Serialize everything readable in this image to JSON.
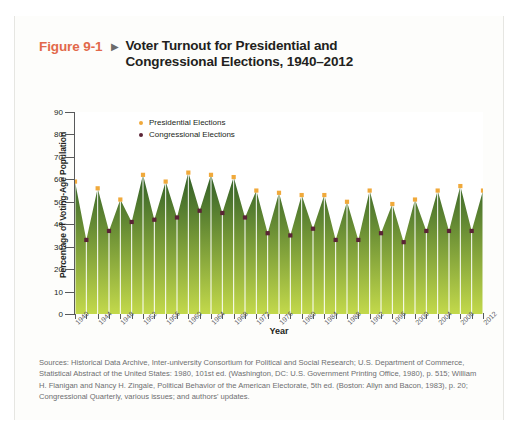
{
  "figure": {
    "label": "Figure 9-1",
    "arrow": "▶",
    "title": "Voter Turnout for Presidential and Congressional Elections, 1940–2012",
    "label_color": "#e2694a"
  },
  "legend": {
    "position": "top-left-inside",
    "items": [
      {
        "label": "Presidential Elections",
        "color": "#f0a93b",
        "marker": "legend-dot-presidential"
      },
      {
        "label": "Congressional Elections",
        "color": "#5b2436",
        "marker": "legend-dot-congressional"
      }
    ]
  },
  "sources": {
    "text": "Sources: Historical Data Archive, Inter-university Consortium for Political and Social Research; U.S. Department of Commerce, Statistical Abstract of the United States: 1980, 101st ed. (Washington, DC: U.S. Government Printing Office, 1980), p. 515; William H. Flanigan and Nancy H. Zingale, Political Behavior of the American Electorate, 5th ed. (Boston: Allyn and Bacon, 1983), p. 20; Congressional Quarterly, various issues; and authors' updates."
  },
  "chart_data": {
    "type": "area",
    "title": "Voter Turnout for Presidential and Congressional Elections, 1940–2012",
    "xlabel": "Year",
    "ylabel": "Percentage of Voting-Age Population",
    "ylim": [
      0,
      90
    ],
    "yticks": [
      0,
      10,
      20,
      30,
      40,
      50,
      60,
      70,
      80,
      90
    ],
    "xlim": [
      1940,
      2012
    ],
    "xticks_labeled": [
      1940,
      1944,
      1948,
      1952,
      1956,
      1960,
      1964,
      1968,
      1972,
      1976,
      1980,
      1984,
      1988,
      1992,
      1996,
      2000,
      2004,
      2008,
      2012
    ],
    "grid": false,
    "x": [
      1940,
      1942,
      1944,
      1946,
      1948,
      1950,
      1952,
      1954,
      1956,
      1958,
      1960,
      1962,
      1964,
      1966,
      1968,
      1970,
      1972,
      1974,
      1976,
      1978,
      1980,
      1982,
      1984,
      1986,
      1988,
      1990,
      1992,
      1994,
      1996,
      1998,
      2000,
      2002,
      2004,
      2006,
      2008,
      2010,
      2012
    ],
    "values": [
      59,
      33,
      56,
      37,
      51,
      41,
      62,
      42,
      59,
      43,
      63,
      46,
      62,
      45,
      61,
      43,
      55,
      36,
      54,
      35,
      53,
      38,
      53,
      33,
      50,
      33,
      55,
      36,
      49,
      32,
      51,
      37,
      55,
      37,
      57,
      37,
      55
    ],
    "series": [
      {
        "name": "Presidential Elections",
        "color": "#f0a93b",
        "x": [
          1940,
          1944,
          1948,
          1952,
          1956,
          1960,
          1964,
          1968,
          1972,
          1976,
          1980,
          1984,
          1988,
          1992,
          1996,
          2000,
          2004,
          2008,
          2012
        ],
        "values": [
          59,
          56,
          51,
          62,
          59,
          63,
          62,
          61,
          55,
          54,
          53,
          53,
          50,
          55,
          49,
          51,
          55,
          57,
          55
        ]
      },
      {
        "name": "Congressional Elections",
        "color": "#5b2436",
        "x": [
          1942,
          1946,
          1950,
          1954,
          1958,
          1962,
          1966,
          1970,
          1974,
          1978,
          1982,
          1986,
          1990,
          1994,
          1998,
          2002,
          2006,
          2010
        ],
        "values": [
          33,
          37,
          41,
          42,
          43,
          46,
          45,
          43,
          36,
          35,
          38,
          33,
          33,
          36,
          32,
          37,
          37,
          37
        ]
      }
    ],
    "area_gradient": {
      "top": "#2f5d26",
      "bottom": "#c3d94b"
    },
    "dropline_color": "#ffffff",
    "axis_color": "#58595b"
  }
}
